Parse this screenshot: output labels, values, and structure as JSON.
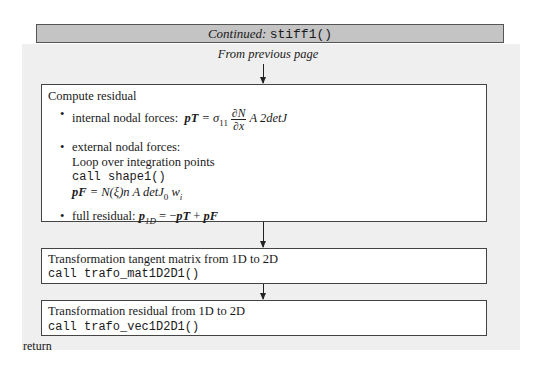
{
  "header": {
    "prefix": "Continued:",
    "func": "stiff1()"
  },
  "from_previous": "From previous page",
  "box1": {
    "title": "Compute residual",
    "internal_label": "internal nodal forces:",
    "internal_formula": {
      "lhs": "pT",
      "eq": " = σ",
      "sub11": "11",
      "num": "∂N",
      "den": "∂x",
      "rhs": " A 2detJ"
    },
    "external_label": "external nodal forces:",
    "external_loop": "Loop over integration points",
    "external_call": "call shape1()",
    "external_formula": {
      "lhs": "pF",
      "rhs": " = N(ξ)n A detJ",
      "sub0": "0",
      "w": " w",
      "subi": "i"
    },
    "full_label": "full residual:",
    "full_formula": {
      "lhs": "p",
      "sub": "1D",
      "rhs_a": " = −",
      "pT": "pT",
      "plus": " + ",
      "pF": "pF"
    }
  },
  "box2": {
    "title": "Transformation tangent matrix from 1D to 2D",
    "call": "call trafo_mat1D2D1()"
  },
  "box3": {
    "title": "Transformation residual from 1D to 2D",
    "call": "call trafo_vec1D2D1()"
  },
  "return_label": "return",
  "colors": {
    "header_bg": "#c4c4c4",
    "panel_bg": "#efefef",
    "box_bg": "#ffffff",
    "border": "#444444"
  }
}
